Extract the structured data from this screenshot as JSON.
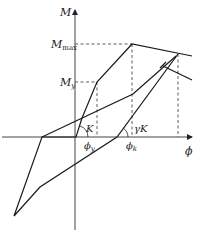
{
  "diagram": {
    "axes": {
      "y_label": "M",
      "x_label": "ϕ"
    },
    "levels": {
      "m_max": {
        "label": "M",
        "sub": "max"
      },
      "m_y": {
        "label": "M",
        "sub": "y"
      }
    },
    "curvatures": {
      "phi_y": {
        "label": "ϕ",
        "sub": "y"
      },
      "phi_k": {
        "label": "ϕ",
        "sub": "k"
      }
    },
    "stiffness_labels": {
      "initial": "K",
      "unloading": "γK"
    },
    "colors": {
      "line": "#1a1a1a",
      "dash": "#333333"
    }
  }
}
